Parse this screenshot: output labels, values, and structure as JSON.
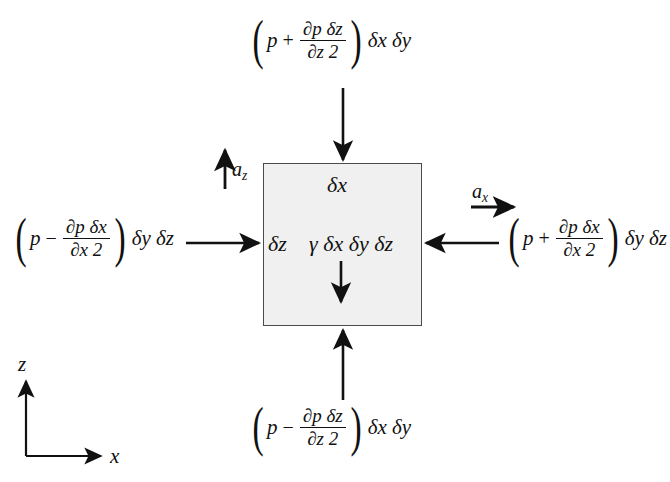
{
  "figure": {
    "background_color": "#ffffff",
    "ink_color": "#111111"
  },
  "element_box": {
    "fill_color": "#f0f0f0",
    "border_color": "#4a4a4a",
    "x": 263,
    "y": 163,
    "width": 159,
    "height": 163,
    "top_dimension_label": "δx",
    "left_dimension_label": "δz",
    "weight_label": "γ δx δy δz"
  },
  "forces": {
    "top": {
      "name": "top-face-pressure-force",
      "open_paren": "(",
      "close_paren": ")",
      "pressure_symbol": "p",
      "operator": "+",
      "numerator": "∂p δz",
      "denominator": "∂z 2",
      "area_term": "δx δy",
      "arrow_direction": "down"
    },
    "bottom": {
      "name": "bottom-face-pressure-force",
      "open_paren": "(",
      "close_paren": ")",
      "pressure_symbol": "p",
      "operator": "−",
      "numerator": "∂p δz",
      "denominator": "∂z 2",
      "area_term": "δx δy",
      "arrow_direction": "up"
    },
    "left": {
      "name": "left-face-pressure-force",
      "open_paren": "(",
      "close_paren": ")",
      "pressure_symbol": "p",
      "operator": "−",
      "numerator": "∂p δx",
      "denominator": "∂x 2",
      "area_term": "δy δz",
      "arrow_direction": "right"
    },
    "right": {
      "name": "right-face-pressure-force",
      "open_paren": "(",
      "close_paren": ")",
      "pressure_symbol": "p",
      "operator": "+",
      "numerator": "∂p δx",
      "denominator": "∂x 2",
      "area_term": "δy δz",
      "arrow_direction": "left"
    }
  },
  "accelerations": {
    "vertical": {
      "symbol": "a",
      "subscript": "z",
      "arrow_direction": "up"
    },
    "horizontal": {
      "symbol": "a",
      "subscript": "x",
      "arrow_direction": "right"
    }
  },
  "axes": {
    "vertical_label": "z",
    "horizontal_label": "x",
    "origin_x": 26,
    "origin_y": 456
  }
}
